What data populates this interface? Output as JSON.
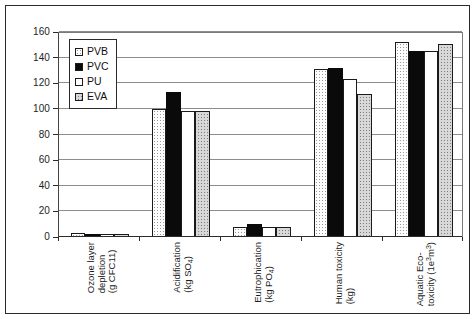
{
  "chart_data": {
    "type": "bar",
    "title": "",
    "subtitle": "",
    "xlabel": "",
    "ylabel": "",
    "ylim": [
      0,
      160
    ],
    "yticks": [
      0,
      20,
      40,
      60,
      80,
      100,
      120,
      140,
      160
    ],
    "ytick_labels": [
      "0",
      "20",
      "40",
      "60",
      "80",
      "100",
      "120",
      "140",
      "160"
    ],
    "grid": "horizontal",
    "legend_position": "upper-left-inside",
    "categories": [
      "Ozone layer depletion (g CFC11)",
      "Acidification (kg SO4)",
      "Eutrophication (kg PO4)",
      "Human toxicity (kg)",
      "Aquatic Eco-toxicity (1e3m3)"
    ],
    "category_lines": [
      [
        "Ozone layer",
        "depletion",
        "(g CFC11)"
      ],
      [
        "Acidification",
        "(kg SO4)"
      ],
      [
        "Eutrophication",
        "(kg PO4)"
      ],
      [
        "Human toxicity",
        "(kg)"
      ],
      [
        "Aquatic Eco-",
        "toxicity (1e3m3)"
      ]
    ],
    "series": [
      {
        "name": "PVB",
        "fill": "dotted-white",
        "values": [
          3,
          100,
          8,
          131,
          152
        ]
      },
      {
        "name": "PVC",
        "fill": "solid-black",
        "values": [
          2,
          113,
          10,
          132,
          145
        ]
      },
      {
        "name": "PU",
        "fill": "white",
        "values": [
          2,
          98,
          8,
          123,
          145
        ]
      },
      {
        "name": "EVA",
        "fill": "dotted-gray",
        "values": [
          2,
          98,
          8,
          112,
          151
        ]
      }
    ]
  },
  "legend": {
    "items": [
      {
        "label": "PVB"
      },
      {
        "label": "PVC"
      },
      {
        "label": "PU"
      },
      {
        "label": "EVA"
      }
    ]
  }
}
